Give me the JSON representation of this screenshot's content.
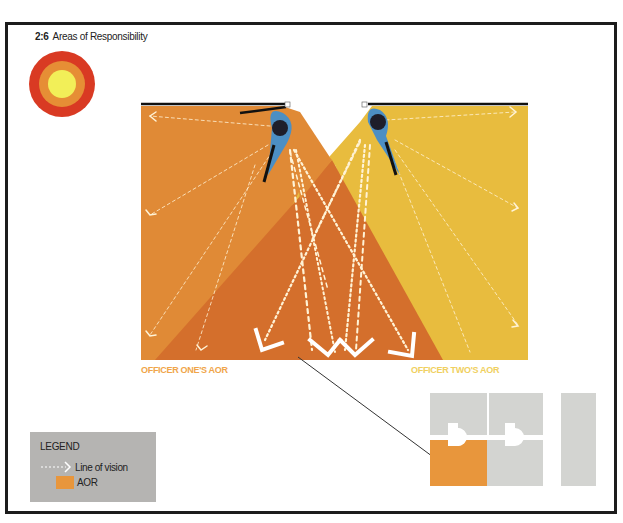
{
  "figure": {
    "number": "2:6",
    "title": "Areas of Responsibility"
  },
  "colors": {
    "frame": "#1c1c1c",
    "aor_officer_one": "#e08a36",
    "aor_officer_two": "#e8bc3e",
    "aor_overlap": "#d46f2c",
    "officer_one_label": "#f0a54a",
    "officer_two_label": "#f0d060",
    "officer_body": "#1e1e2a",
    "officer_outline": "#4c8fc4",
    "vision_line": "#fff3d6",
    "target_outer": "#d93a23",
    "target_middle": "#e68e35",
    "target_inner": "#f2ef58",
    "legend_bg": "#b5b4b2",
    "floorplan_gray": "#d3d4d1",
    "floorplan_highlight": "#e8963c"
  },
  "labels": {
    "officer_one_aor": "OFFICER ONE'S AOR",
    "officer_two_aor": "OFFICER TWO'S AOR"
  },
  "legend": {
    "title": "LEGEND",
    "items": [
      {
        "icon": "dashed-arrow-icon",
        "label": "Line of vision"
      },
      {
        "icon": "orange-swatch",
        "label": "AOR"
      }
    ]
  },
  "icons": {
    "target": "concentric-circles-icon",
    "officer_one": "officer-top-view-icon",
    "officer_two": "officer-top-view-icon",
    "floor_plan": "floor-plan-icon"
  }
}
